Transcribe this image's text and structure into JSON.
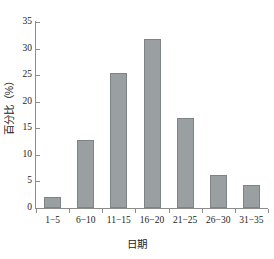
{
  "chart_data": {
    "type": "bar",
    "title": "",
    "xlabel": "日期",
    "ylabel": "百分比（%）",
    "categories": [
      "1−5",
      "6−10",
      "11−15",
      "16−20",
      "21−25",
      "26−30",
      "31−35"
    ],
    "values": [
      2.1,
      12.8,
      25.5,
      31.8,
      17.0,
      6.3,
      4.3
    ],
    "ylim": [
      0,
      35
    ],
    "yticks": [
      0,
      5,
      10,
      15,
      20,
      25,
      30,
      35
    ],
    "ytick_labels": [
      "0",
      "5",
      "10",
      "15",
      "20",
      "25",
      "30",
      "35"
    ],
    "grid": false,
    "legend": null,
    "bar_color": "#9a9fa1",
    "bar_edge_color": "#7e8385",
    "axis_color": "#8d8d8d",
    "text_color": "#1b1b1b",
    "background": "#ffffff"
  }
}
